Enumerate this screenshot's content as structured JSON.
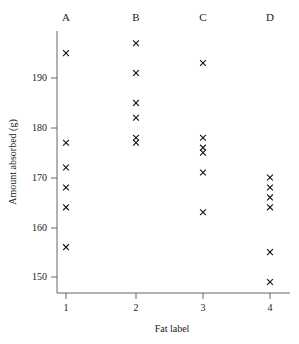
{
  "chart_data": {
    "type": "scatter",
    "title": "",
    "subtitle": "",
    "xlabel": "Fat label",
    "ylabel": "Amount absorbed (g)",
    "xlim": [
      0.6,
      4.45
    ],
    "ylim": [
      147,
      199
    ],
    "grid": false,
    "legend": "none",
    "marker": "x",
    "marker_color": "#111111",
    "x_ticks": [
      "1",
      "2",
      "3",
      "4"
    ],
    "x_tick_values": [
      1,
      2,
      3,
      4
    ],
    "y_ticks": [
      "150",
      "160",
      "170",
      "180",
      "190"
    ],
    "y_tick_values": [
      150,
      160,
      170,
      180,
      190
    ],
    "category_labels": [
      "A",
      "B",
      "C",
      "D"
    ],
    "series": [
      {
        "name": "A",
        "x": 1,
        "values": [
          195,
          177,
          172,
          168,
          164,
          156
        ]
      },
      {
        "name": "B",
        "x": 2,
        "values": [
          197,
          191,
          185,
          182,
          178,
          177
        ]
      },
      {
        "name": "C",
        "x": 3,
        "values": [
          193,
          178,
          176,
          175,
          171,
          163
        ]
      },
      {
        "name": "D",
        "x": 4,
        "values": [
          170,
          168,
          166,
          164,
          155,
          149
        ]
      }
    ]
  },
  "axes": {
    "x_title": "Fat label",
    "y_title": "Amount absorbed (g)"
  },
  "categories": {
    "a": "A",
    "b": "B",
    "c": "C",
    "d": "D"
  },
  "y_tick_labels": {
    "t150": "150",
    "t160": "160",
    "t170": "170",
    "t180": "180",
    "t190": "190"
  },
  "x_tick_labels": {
    "t1": "1",
    "t2": "2",
    "t3": "3",
    "t4": "4"
  },
  "colors": {
    "marker": "#111111",
    "axis": "#555555",
    "background": "#ffffff",
    "text": "#1a1a1a"
  }
}
